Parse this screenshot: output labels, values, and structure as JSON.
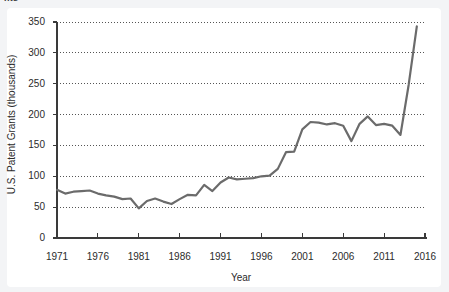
{
  "title_fragment": "nts",
  "chart_data": {
    "type": "line",
    "title": "",
    "xlabel": "Year",
    "ylabel": "U.S. Patent Grants (thousands)",
    "xlim": [
      1971,
      2016
    ],
    "ylim": [
      0,
      350
    ],
    "xticks": [
      1971,
      1976,
      1981,
      1986,
      1991,
      1996,
      2001,
      2006,
      2011,
      2016
    ],
    "yticks": [
      0,
      50,
      100,
      150,
      200,
      250,
      300,
      350
    ],
    "grid": "horizontal-dotted",
    "legend": "none",
    "line_color": "#6b6b6b",
    "line_width": 2.2,
    "x": [
      1971,
      1972,
      1973,
      1974,
      1975,
      1976,
      1977,
      1978,
      1979,
      1980,
      1981,
      1982,
      1983,
      1984,
      1985,
      1986,
      1987,
      1988,
      1989,
      1990,
      1991,
      1992,
      1993,
      1994,
      1995,
      1996,
      1997,
      1998,
      1999,
      2000,
      2001,
      2002,
      2003,
      2004,
      2005,
      2006,
      2007,
      2008,
      2009,
      2010,
      2011,
      2012,
      2013,
      2014,
      2015
    ],
    "y": [
      78,
      72,
      75,
      76,
      77,
      72,
      69,
      67,
      63,
      64,
      48,
      60,
      64,
      59,
      55,
      63,
      70,
      69,
      86,
      76,
      90,
      98,
      95,
      96,
      97,
      100,
      101,
      112,
      139,
      140,
      176,
      188,
      187,
      184,
      186,
      182,
      157,
      185,
      197,
      183,
      185,
      182,
      167,
      248,
      343
    ],
    "series": [
      {
        "name": "U.S. Patent Grants",
        "values": [
          78,
          72,
          75,
          76,
          77,
          72,
          69,
          67,
          63,
          64,
          48,
          60,
          64,
          59,
          55,
          63,
          70,
          69,
          86,
          76,
          90,
          98,
          95,
          96,
          97,
          100,
          101,
          112,
          139,
          140,
          176,
          188,
          187,
          184,
          186,
          182,
          157,
          185,
          197,
          183,
          185,
          182,
          167,
          248,
          343
        ]
      }
    ]
  }
}
